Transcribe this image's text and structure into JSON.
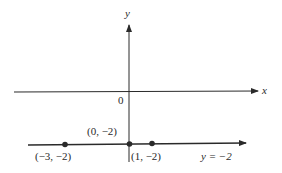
{
  "diagram": {
    "axes": {
      "x_label": "x",
      "y_label": "y",
      "origin_label": "0"
    },
    "line": {
      "equation_label": "y = −2",
      "y_value": -2
    },
    "points": [
      {
        "label": "(−3, −2)",
        "x": -3,
        "y": -2
      },
      {
        "label": "(0, −2)",
        "x": 0,
        "y": -2
      },
      {
        "label": "(1, −2)",
        "x": 1,
        "y": -2
      }
    ],
    "colors": {
      "ink": "#2a2a2a",
      "background": "#ffffff"
    }
  }
}
